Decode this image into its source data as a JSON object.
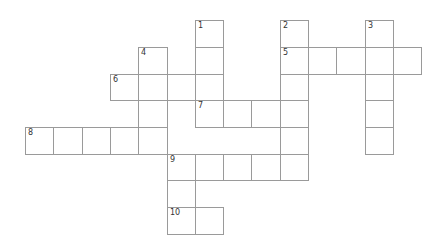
{
  "puzzle": {
    "type": "crossword",
    "grid_origin": {
      "x": 25,
      "y": 20.3
    },
    "cell_width": 28.3,
    "cell_height": 26.65,
    "line_color": "#9a9a9a",
    "number_color": "#333333",
    "clues": {
      "across": [
        {
          "number": "5",
          "row": 1,
          "col": 9,
          "length": 5
        },
        {
          "number": "6",
          "row": 2,
          "col": 3,
          "length": 4
        },
        {
          "number": "7",
          "row": 3,
          "col": 6,
          "length": 4
        },
        {
          "number": "8",
          "row": 4,
          "col": 0,
          "length": 5
        },
        {
          "number": "9",
          "row": 5,
          "col": 5,
          "length": 5
        },
        {
          "number": "10",
          "row": 7,
          "col": 5,
          "length": 2
        }
      ],
      "down": [
        {
          "number": "1",
          "row": 0,
          "col": 6,
          "length": 4
        },
        {
          "number": "2",
          "row": 0,
          "col": 9,
          "length": 6
        },
        {
          "number": "3",
          "row": 0,
          "col": 12,
          "length": 5
        },
        {
          "number": "4",
          "row": 1,
          "col": 4,
          "length": 4
        },
        {
          "number": "9",
          "row": 5,
          "col": 5,
          "length": 3
        }
      ]
    },
    "cell_values": {}
  }
}
